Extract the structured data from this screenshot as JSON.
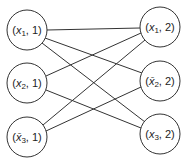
{
  "diagram": {
    "type": "bipartite-graph",
    "left_nodes": [
      {
        "id": "x1_1",
        "var": "x",
        "sub": "1",
        "bar": false,
        "part": "1",
        "cx": 27,
        "cy": 30
      },
      {
        "id": "x2_1",
        "var": "x",
        "sub": "2",
        "bar": false,
        "part": "1",
        "cx": 27,
        "cy": 83
      },
      {
        "id": "x3bar_1",
        "var": "x",
        "sub": "3",
        "bar": true,
        "part": "1",
        "cx": 27,
        "cy": 137
      }
    ],
    "right_nodes": [
      {
        "id": "x1_2",
        "var": "x",
        "sub": "1",
        "bar": false,
        "part": "2",
        "cx": 160,
        "cy": 27
      },
      {
        "id": "x2bar_2",
        "var": "x",
        "sub": "2",
        "bar": true,
        "part": "2",
        "cx": 160,
        "cy": 81
      },
      {
        "id": "x3_2",
        "var": "x",
        "sub": "3",
        "bar": false,
        "part": "2",
        "cx": 160,
        "cy": 134
      }
    ],
    "edges": [
      [
        "x1_1",
        "x1_2"
      ],
      [
        "x1_1",
        "x2bar_2"
      ],
      [
        "x1_1",
        "x3_2"
      ],
      [
        "x2_1",
        "x1_2"
      ],
      [
        "x2_1",
        "x3_2"
      ],
      [
        "x3bar_1",
        "x1_2"
      ],
      [
        "x3bar_1",
        "x2bar_2"
      ]
    ],
    "labels": {
      "x1_1": {
        "open": "(",
        "var": "x",
        "sub": "1",
        "rest": ", 1)"
      },
      "x2_1": {
        "open": "(",
        "var": "x",
        "sub": "2",
        "rest": ", 1)"
      },
      "x3bar_1": {
        "open": "(",
        "var": "x̄",
        "sub": "3",
        "rest": ", 1)"
      },
      "x1_2": {
        "open": "(",
        "var": "x",
        "sub": "1",
        "rest": ", 2)"
      },
      "x2bar_2": {
        "open": "(",
        "var": "x̄",
        "sub": "2",
        "rest": ", 2)"
      },
      "x3_2": {
        "open": "(",
        "var": "x",
        "sub": "3",
        "rest": ", 2)"
      }
    },
    "radius": 20
  }
}
